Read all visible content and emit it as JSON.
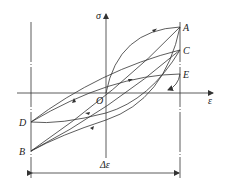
{
  "diagram": {
    "type": "stress-strain hysteresis loops",
    "axes": {
      "x_label": "ε",
      "y_label": "σ",
      "origin_label": "O"
    },
    "points": {
      "A": "A",
      "B": "B",
      "C": "C",
      "D": "D",
      "E": "E"
    },
    "dimension_label": "Δε",
    "colors": {
      "line": "#333333",
      "background": "#ffffff"
    }
  }
}
